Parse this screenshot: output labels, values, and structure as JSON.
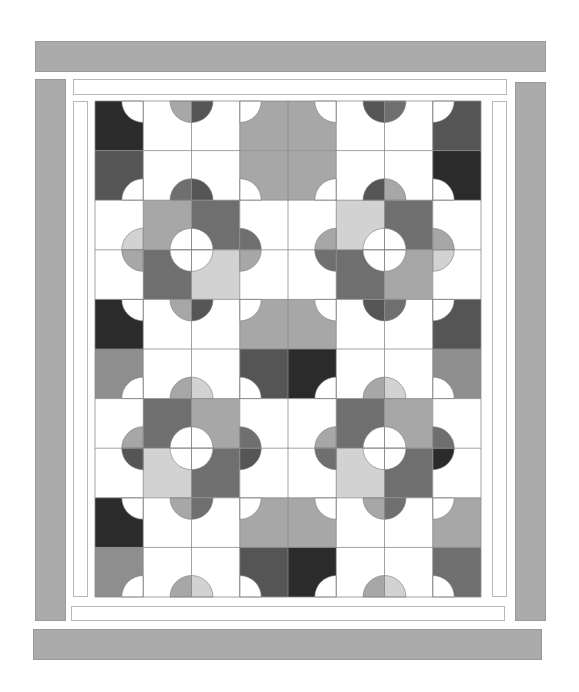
{
  "quilt": {
    "title": "",
    "grid": {
      "cols": 8,
      "rows": 10,
      "x": 95,
      "y": 101,
      "cell_w": 48.25,
      "cell_h": 49.6,
      "radius": 21.5,
      "line_color": "#8a8a8a"
    },
    "palette": {
      "K": "#2b2b2b",
      "D": "#555555",
      "M": "#6f6f6f",
      "G": "#8e8e8e",
      "L": "#a7a7a7",
      "P": "#d2d2d2",
      "W": "#ffffff"
    },
    "borders": {
      "outer_color": "#ababab",
      "inner_color": "#ffffff",
      "outer": [
        {
          "name": "outer-border-top",
          "x": 35,
          "y": 41,
          "w": 511,
          "h": 31
        },
        {
          "name": "outer-border-left",
          "x": 35,
          "y": 79,
          "w": 31,
          "h": 542
        },
        {
          "name": "outer-border-right",
          "x": 515,
          "y": 82,
          "w": 31,
          "h": 539
        },
        {
          "name": "outer-border-bottom",
          "x": 33,
          "y": 629,
          "w": 509,
          "h": 31
        }
      ],
      "inner": [
        {
          "name": "inner-border-top",
          "x": 73,
          "y": 79,
          "w": 434,
          "h": 16
        },
        {
          "name": "inner-border-left",
          "x": 73,
          "y": 101,
          "w": 15,
          "h": 496
        },
        {
          "name": "inner-border-right",
          "x": 492,
          "y": 101,
          "w": 15,
          "h": 496
        },
        {
          "name": "inner-border-bottom",
          "x": 71,
          "y": 606,
          "w": 434,
          "h": 15
        }
      ]
    },
    "cells": [
      [
        "K",
        "W",
        "W",
        "L",
        "L",
        "W",
        "W",
        "D"
      ],
      [
        "D",
        "W",
        "W",
        "L",
        "L",
        "W",
        "W",
        "K"
      ],
      [
        "W",
        "L",
        "M",
        "W",
        "W",
        "P",
        "M",
        "W"
      ],
      [
        "W",
        "M",
        "P",
        "W",
        "W",
        "M",
        "L",
        "W"
      ],
      [
        "K",
        "W",
        "W",
        "L",
        "L",
        "W",
        "W",
        "D"
      ],
      [
        "G",
        "W",
        "W",
        "D",
        "K",
        "W",
        "W",
        "G"
      ],
      [
        "W",
        "M",
        "L",
        "W",
        "W",
        "M",
        "L",
        "W"
      ],
      [
        "W",
        "P",
        "M",
        "W",
        "W",
        "P",
        "M",
        "W"
      ],
      [
        "K",
        "W",
        "W",
        "L",
        "L",
        "W",
        "W",
        "L"
      ],
      [
        "G",
        "W",
        "W",
        "D",
        "K",
        "W",
        "W",
        "M"
      ]
    ],
    "vertex_circles": [
      {
        "c": 1,
        "r": 0,
        "BL": "W"
      },
      {
        "c": 1,
        "r": 2,
        "TL": "W"
      },
      {
        "c": 2,
        "r": 0,
        "BL": "L",
        "BR": "D"
      },
      {
        "c": 2,
        "r": 2,
        "TL": "M",
        "TR": "D"
      },
      {
        "c": 3,
        "r": 0,
        "BR": "W"
      },
      {
        "c": 5,
        "r": 0,
        "BL": "W"
      },
      {
        "c": 3,
        "r": 2,
        "TR": "W"
      },
      {
        "c": 5,
        "r": 2,
        "TL": "W"
      },
      {
        "c": 6,
        "r": 0,
        "BL": "D",
        "BR": "M"
      },
      {
        "c": 6,
        "r": 2,
        "TL": "D",
        "TR": "L"
      },
      {
        "c": 7,
        "r": 0,
        "BR": "W"
      },
      {
        "c": 7,
        "r": 2,
        "TR": "W"
      },
      {
        "c": 2,
        "r": 3,
        "TL": "W",
        "TR": "W",
        "BL": "W",
        "BR": "W"
      },
      {
        "c": 6,
        "r": 3,
        "TL": "W",
        "TR": "W",
        "BL": "W",
        "BR": "W"
      },
      {
        "c": 1,
        "r": 3,
        "TL": "P",
        "BL": "L"
      },
      {
        "c": 3,
        "r": 3,
        "TR": "M",
        "BR": "L"
      },
      {
        "c": 5,
        "r": 3,
        "TL": "L",
        "BL": "M"
      },
      {
        "c": 7,
        "r": 3,
        "TR": "L",
        "BR": "P"
      },
      {
        "c": 1,
        "r": 4,
        "BL": "W"
      },
      {
        "c": 1,
        "r": 6,
        "TL": "W"
      },
      {
        "c": 2,
        "r": 4,
        "BL": "L",
        "BR": "D"
      },
      {
        "c": 2,
        "r": 6,
        "TL": "L",
        "TR": "P"
      },
      {
        "c": 3,
        "r": 4,
        "BR": "W"
      },
      {
        "c": 5,
        "r": 4,
        "BL": "W"
      },
      {
        "c": 3,
        "r": 6,
        "TR": "W"
      },
      {
        "c": 5,
        "r": 6,
        "TL": "W"
      },
      {
        "c": 6,
        "r": 4,
        "BL": "D",
        "BR": "M"
      },
      {
        "c": 6,
        "r": 6,
        "TL": "L",
        "TR": "P"
      },
      {
        "c": 7,
        "r": 4,
        "BR": "W"
      },
      {
        "c": 7,
        "r": 6,
        "TR": "W"
      },
      {
        "c": 2,
        "r": 7,
        "TL": "W",
        "TR": "W",
        "BL": "W",
        "BR": "W"
      },
      {
        "c": 6,
        "r": 7,
        "TL": "W",
        "TR": "W",
        "BL": "W",
        "BR": "W"
      },
      {
        "c": 1,
        "r": 7,
        "TL": "L",
        "BL": "D"
      },
      {
        "c": 3,
        "r": 7,
        "TR": "M",
        "BR": "D"
      },
      {
        "c": 5,
        "r": 7,
        "TL": "L",
        "BL": "M"
      },
      {
        "c": 7,
        "r": 7,
        "TR": "M",
        "BR": "K"
      },
      {
        "c": 1,
        "r": 8,
        "BL": "W"
      },
      {
        "c": 1,
        "r": 10,
        "TL": "W"
      },
      {
        "c": 2,
        "r": 8,
        "BL": "L",
        "BR": "M"
      },
      {
        "c": 2,
        "r": 10,
        "TL": "L",
        "TR": "P"
      },
      {
        "c": 3,
        "r": 8,
        "BR": "W"
      },
      {
        "c": 5,
        "r": 8,
        "BL": "W"
      },
      {
        "c": 3,
        "r": 10,
        "TR": "W"
      },
      {
        "c": 5,
        "r": 10,
        "TL": "W"
      },
      {
        "c": 6,
        "r": 8,
        "BL": "L",
        "BR": "M"
      },
      {
        "c": 6,
        "r": 10,
        "TL": "L",
        "TR": "P"
      },
      {
        "c": 7,
        "r": 8,
        "BR": "W"
      },
      {
        "c": 7,
        "r": 10,
        "TR": "W"
      }
    ]
  }
}
